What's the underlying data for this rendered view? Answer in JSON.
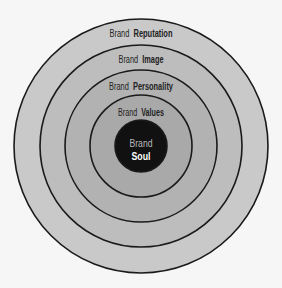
{
  "diagram": {
    "type": "concentric-circles",
    "center": {
      "x": 141,
      "y": 146
    },
    "layers": [
      {
        "id": "reputation",
        "prefix": "Brand",
        "keyword": "Reputation",
        "radius": 127,
        "fill": "#c9c9c9",
        "label_y": 37,
        "label_width": 63,
        "prefix_width": 24
      },
      {
        "id": "image",
        "prefix": "Brand",
        "keyword": "Image",
        "radius": 101,
        "fill": "#bdbdbd",
        "label_y": 63,
        "label_width": 45,
        "prefix_width": 24
      },
      {
        "id": "personality",
        "prefix": "Brand",
        "keyword": "Personality",
        "radius": 76,
        "fill": "#b2b2b2",
        "label_y": 90,
        "label_width": 64,
        "prefix_width": 24
      },
      {
        "id": "values",
        "prefix": "Brand",
        "keyword": "Values",
        "radius": 51,
        "fill": "#a9a9a9",
        "label_y": 116,
        "label_width": 46,
        "prefix_width": 24
      },
      {
        "id": "soul",
        "prefix": "Brand",
        "keyword": "Soul",
        "radius": 26,
        "fill": "#111111",
        "label_y": 147,
        "label_y2": 160
      }
    ],
    "colors": {
      "background": "#f6f6f6",
      "ring_stroke": "#1a1a1a",
      "label_text": "#222222",
      "core_prefix_text": "#b8b8b8",
      "core_keyword_text": "#ffffff"
    }
  }
}
